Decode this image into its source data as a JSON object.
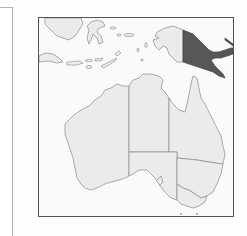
{
  "map": {
    "type": "locator-map",
    "region": "Australia and Oceania",
    "highlighted_country": "Papua New Guinea",
    "colors": {
      "land": "#ebebeb",
      "sea": "#fafafa",
      "outline": "#8a8a8a",
      "highlight": "#565656",
      "frame": "#555555"
    },
    "features": [
      {
        "name": "Papua New Guinea",
        "highlighted": true
      },
      {
        "name": "Western New Guinea",
        "highlighted": false
      },
      {
        "name": "Borneo",
        "highlighted": false
      },
      {
        "name": "Sulawesi",
        "highlighted": false
      },
      {
        "name": "Java",
        "highlighted": false
      },
      {
        "name": "Lesser Sunda Islands",
        "highlighted": false
      },
      {
        "name": "Western Australia",
        "highlighted": false
      },
      {
        "name": "Northern Territory",
        "highlighted": false
      },
      {
        "name": "Queensland",
        "highlighted": false
      },
      {
        "name": "South Australia",
        "highlighted": false
      },
      {
        "name": "New South Wales",
        "highlighted": false
      },
      {
        "name": "Victoria",
        "highlighted": false
      },
      {
        "name": "Tasmania",
        "highlighted": false
      }
    ]
  }
}
